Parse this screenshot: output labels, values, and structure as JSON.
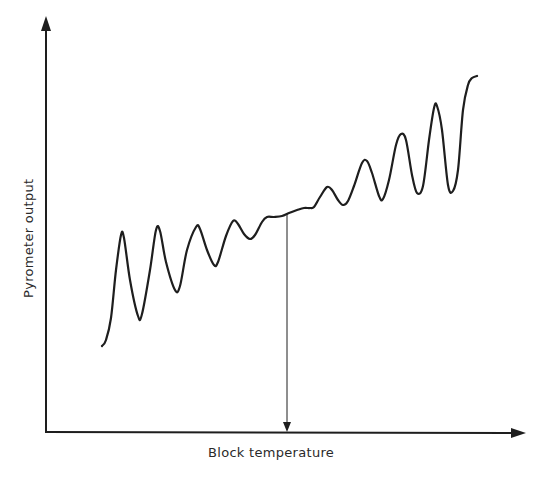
{
  "figure": {
    "x_axis_label": "Block temperature",
    "y_axis_label": "Pyrometer output",
    "line_color": "#1e1e1e",
    "background": "#ffffff"
  },
  "chart_data": {
    "type": "line",
    "title": "",
    "xlabel": "Block temperature",
    "ylabel": "Pyrometer output",
    "grid": false,
    "legend": null,
    "ticks": "none",
    "annotation": {
      "type": "vertical-arrow",
      "x_px": 287,
      "from_y_px": 213,
      "to_y_px": 430,
      "meaning": "minimum oscillation (marked temperature)"
    },
    "series": [
      {
        "name": "Pyrometer output",
        "points_px": [
          [
            102,
            346
          ],
          [
            106,
            340
          ],
          [
            111,
            318
          ],
          [
            116,
            270
          ],
          [
            121,
            235
          ],
          [
            124,
            238
          ],
          [
            130,
            280
          ],
          [
            138,
            316
          ],
          [
            142,
            314
          ],
          [
            150,
            270
          ],
          [
            156,
            230
          ],
          [
            160,
            231
          ],
          [
            166,
            262
          ],
          [
            175,
            290
          ],
          [
            180,
            286
          ],
          [
            187,
            250
          ],
          [
            196,
            227
          ],
          [
            200,
            229
          ],
          [
            207,
            250
          ],
          [
            214,
            265
          ],
          [
            218,
            262
          ],
          [
            226,
            236
          ],
          [
            233,
            221
          ],
          [
            238,
            224
          ],
          [
            244,
            234
          ],
          [
            250,
            239
          ],
          [
            255,
            235
          ],
          [
            262,
            222
          ],
          [
            267,
            217
          ],
          [
            274,
            217
          ],
          [
            282,
            216
          ],
          [
            289,
            213
          ],
          [
            297,
            210
          ],
          [
            304,
            208
          ],
          [
            310,
            208
          ],
          [
            314,
            207
          ],
          [
            320,
            197
          ],
          [
            327,
            187
          ],
          [
            332,
            190
          ],
          [
            338,
            200
          ],
          [
            343,
            205
          ],
          [
            348,
            201
          ],
          [
            354,
            186
          ],
          [
            362,
            163
          ],
          [
            367,
            161
          ],
          [
            372,
            173
          ],
          [
            379,
            196
          ],
          [
            383,
            199
          ],
          [
            389,
            180
          ],
          [
            396,
            145
          ],
          [
            401,
            134
          ],
          [
            406,
            140
          ],
          [
            412,
            175
          ],
          [
            417,
            193
          ],
          [
            423,
            186
          ],
          [
            429,
            140
          ],
          [
            434,
            108
          ],
          [
            437,
            106
          ],
          [
            442,
            130
          ],
          [
            448,
            185
          ],
          [
            453,
            191
          ],
          [
            458,
            170
          ],
          [
            463,
            110
          ],
          [
            468,
            85
          ],
          [
            472,
            78
          ],
          [
            477,
            76
          ]
        ]
      }
    ]
  }
}
